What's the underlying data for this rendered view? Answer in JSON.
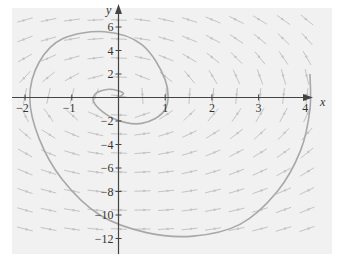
{
  "chart_data": {
    "type": "line",
    "title": "",
    "subtitle": "",
    "xlabel": "x",
    "ylabel": "y",
    "xlim": [
      -2.2,
      4.6
    ],
    "ylim": [
      -13,
      7
    ],
    "grid": false,
    "legend": null,
    "x_ticks": [
      "-2",
      "-1",
      "1",
      "2",
      "3",
      "4"
    ],
    "y_ticks": [
      "6",
      "4",
      "2",
      "-2",
      "-4",
      "-6",
      "-8",
      "-10",
      "-12"
    ],
    "background": "direction field (slope arrows) over light gray panel",
    "series": [
      {
        "name": "solution trajectory (spiral out from origin)",
        "points": [
          [
            0,
            0
          ],
          [
            0.1,
            0.4
          ],
          [
            -0.2,
            0.7
          ],
          [
            -0.5,
            0.3
          ],
          [
            -0.5,
            -0.6
          ],
          [
            -0.1,
            -1.8
          ],
          [
            0.5,
            -2.2
          ],
          [
            1.0,
            -1.0
          ],
          [
            1.0,
            1.5
          ],
          [
            0.5,
            4.5
          ],
          [
            -0.3,
            5.6
          ],
          [
            -1.2,
            5.0
          ],
          [
            -1.7,
            3.0
          ],
          [
            -1.9,
            0.0
          ],
          [
            -1.7,
            -3.5
          ],
          [
            -1.2,
            -7.0
          ],
          [
            -0.4,
            -10.0
          ],
          [
            0.6,
            -11.5
          ],
          [
            1.6,
            -11.8
          ],
          [
            2.6,
            -10.8
          ],
          [
            3.4,
            -8.0
          ],
          [
            3.9,
            -4.5
          ],
          [
            4.1,
            -1.0
          ],
          [
            4.1,
            2.0
          ]
        ]
      }
    ],
    "colors": {
      "panel": "#f1f1f1",
      "axis": "#444444",
      "curve": "#aaaaaa",
      "arrows": "#c4c4c4"
    }
  }
}
